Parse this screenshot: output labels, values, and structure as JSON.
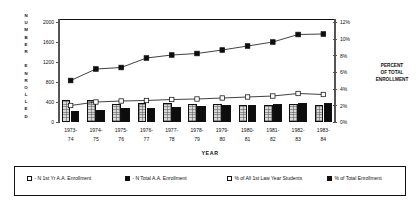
{
  "axes": {
    "y_left_title": "NUMBER ENROLLED",
    "y_left_title_chars": [
      "N",
      "U",
      "M",
      "B",
      "E",
      "R",
      "",
      "E",
      "N",
      "R",
      "O",
      "L",
      "L",
      "E",
      "D"
    ],
    "y_right_title_lines": [
      "PERCENT",
      "OF TOTAL",
      "ENROLLMENT"
    ],
    "x_title": "YEAR",
    "y_left_ticks": [
      "2000",
      "1600",
      "1200",
      "800",
      "400",
      "0"
    ],
    "y_right_ticks": [
      "12%",
      "10%",
      "8%",
      "6%",
      "4%",
      "2%",
      "0%"
    ]
  },
  "legend": {
    "items": [
      {
        "marker": "open-square-icon",
        "label": "N 1st Yr A.A. Enrollment"
      },
      {
        "marker": "filled-square-icon",
        "label": "N Total A.A. Enrollment"
      },
      {
        "marker": "open-square-icon",
        "label": "% of All 1st Law Year Students"
      },
      {
        "marker": "filled-square-icon",
        "label": "% of Total Enrollment"
      }
    ]
  },
  "chart_data": {
    "type": "line",
    "title": "",
    "xlabel": "YEAR",
    "ylabel": "NUMBER ENROLLED",
    "y2label": "PERCENT OF TOTAL ENROLLMENT",
    "grid": false,
    "legend_position": "bottom",
    "categories": [
      "1973-74",
      "1974-75",
      "1975-76",
      "1976-77",
      "1977-78",
      "1978-79",
      "1979-80",
      "1980-81",
      "1981-82",
      "1982-83",
      "1983-84"
    ],
    "category_lines": [
      [
        "1973-",
        "74"
      ],
      [
        "1974-",
        "75"
      ],
      [
        "1975-",
        "76"
      ],
      [
        "1976-",
        "77"
      ],
      [
        "1977-",
        "78"
      ],
      [
        "1978-",
        "79"
      ],
      [
        "1979-",
        "80"
      ],
      [
        "1980-",
        "81"
      ],
      [
        "1981-",
        "82"
      ],
      [
        "1982-",
        "83"
      ],
      [
        "1983-",
        "84"
      ]
    ],
    "ylim": [
      0,
      2000
    ],
    "y2lim": [
      0,
      12
    ],
    "series": [
      {
        "name": "N Total A.A. Enrollment",
        "type": "line",
        "axis": "left",
        "marker": "filled-square",
        "values": [
          830,
          1060,
          1090,
          1280,
          1340,
          1370,
          1440,
          1520,
          1600,
          1750,
          1760
        ]
      },
      {
        "name": "N 1st Yr A.A. Enrollment",
        "type": "line",
        "axis": "left",
        "marker": "open-square",
        "values": [
          330,
          400,
          420,
          430,
          450,
          460,
          480,
          500,
          520,
          570,
          550
        ]
      },
      {
        "name": "% of All 1st Law Year Students",
        "type": "bar",
        "axis": "right",
        "fill": "hatched",
        "values": [
          2.6,
          2.6,
          2.1,
          2.2,
          2.2,
          2.1,
          2.1,
          2.0,
          2.0,
          2.1,
          2.0
        ]
      },
      {
        "name": "% of Total Enrollment",
        "type": "bar",
        "axis": "right",
        "fill": "solid",
        "values": [
          1.3,
          1.4,
          1.6,
          1.7,
          1.8,
          1.9,
          2.0,
          2.0,
          2.1,
          2.2,
          2.2
        ]
      }
    ]
  }
}
